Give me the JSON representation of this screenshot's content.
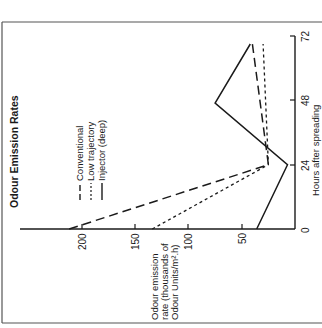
{
  "chart_data": {
    "type": "line",
    "title": "Odour Emission Rates",
    "orientation": "rotated 90° counter-clockwise (x-axis vertical on right, y-axis horizontal at bottom)",
    "xlabel": "Hours after spreading",
    "ylabel_lines": [
      "Odour emission",
      "rate (thousands of",
      "Odour Units/m².h)"
    ],
    "ylabel": "Odour emission rate (thousands of Odour Units/m².h)",
    "x_ticks": [
      "0",
      "24",
      "48",
      "72"
    ],
    "y_ticks": [
      "50",
      "100",
      "150",
      "200"
    ],
    "y_zero_label": "0",
    "xlim": [
      0,
      72
    ],
    "ylim": [
      0,
      220
    ],
    "grid": false,
    "legend_position": "upper-left (rotated)",
    "series": [
      {
        "name": "Conventional",
        "style": "long-dash",
        "x": [
          0,
          24,
          69
        ],
        "values": [
          212,
          25,
          40
        ]
      },
      {
        "name": "Low trajectory",
        "style": "short-dash",
        "x": [
          0,
          24,
          69
        ],
        "values": [
          134,
          25,
          30
        ]
      },
      {
        "name": "Injector  (deep)",
        "style": "solid",
        "x": [
          0,
          24,
          47,
          69
        ],
        "values": [
          36,
          7,
          75,
          42
        ]
      }
    ]
  },
  "legend": {
    "items": [
      "Conventional",
      "Low trajectory",
      "Injector  (deep)"
    ]
  },
  "colors": {
    "ink": "#1a1a1a",
    "border": "#555555",
    "background": "#ffffff"
  }
}
